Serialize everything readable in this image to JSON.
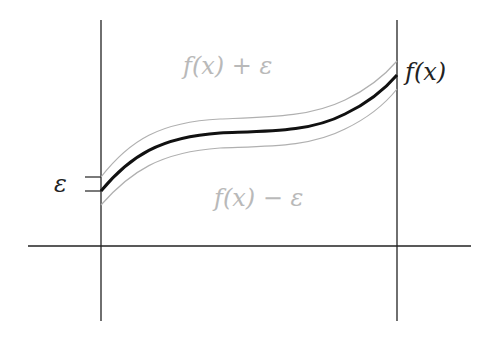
{
  "diagram": {
    "labels": {
      "upper_band": "f(x) + ε",
      "lower_band": "f(x) − ε",
      "function": "f(x)",
      "epsilon": "ε"
    },
    "colors": {
      "axis": "#222222",
      "curve": "#111111",
      "band": "#b0b0b0",
      "band_label": "#b9b9b9"
    },
    "curve_points": [
      [
        101,
        191
      ],
      [
        130,
        165
      ],
      [
        160,
        147
      ],
      [
        200,
        136
      ],
      [
        250,
        133
      ],
      [
        300,
        130
      ],
      [
        350,
        112
      ],
      [
        397,
        75
      ]
    ],
    "band_offset_px": 14
  }
}
